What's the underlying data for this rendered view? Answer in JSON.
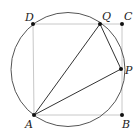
{
  "diagram": {
    "points": {
      "A": {
        "label": "A"
      },
      "B": {
        "label": "B"
      },
      "C": {
        "label": "C"
      },
      "D": {
        "label": "D"
      },
      "P": {
        "label": "P"
      },
      "Q": {
        "label": "Q"
      }
    },
    "segments": [
      {
        "from": "A",
        "to": "Q"
      },
      {
        "from": "A",
        "to": "P"
      },
      {
        "from": "Q",
        "to": "P"
      }
    ],
    "square": [
      "A",
      "B",
      "C",
      "D"
    ],
    "colors": {
      "square_edges": "#c8c8c8",
      "circle": "#555555",
      "segments": "#333333",
      "points": "#111111"
    }
  }
}
